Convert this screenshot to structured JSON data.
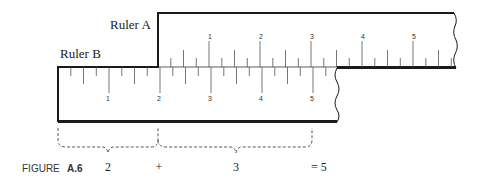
{
  "figure": {
    "caption_prefix": "FIGURE",
    "caption_number": "A.6"
  },
  "ruler_a": {
    "label": "Ruler A",
    "tick_labels": [
      "1",
      "2",
      "3",
      "4",
      "5"
    ]
  },
  "ruler_b": {
    "label": "Ruler B",
    "tick_labels": [
      "1",
      "2",
      "3",
      "4",
      "5"
    ]
  },
  "equation": {
    "term1": "2",
    "op_plus": "+",
    "term2": "3",
    "result": "= 5"
  },
  "colors": {
    "line": "#1a1a1a",
    "tick": "#555555",
    "dash": "#444444"
  }
}
